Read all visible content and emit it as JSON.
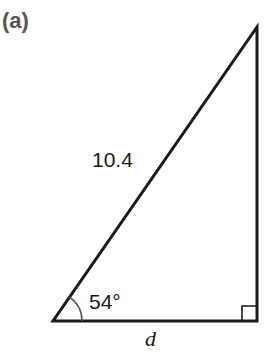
{
  "figure": {
    "part_label": "(a)",
    "hypotenuse_label": "10.4",
    "angle_label": "54°",
    "base_label": "d",
    "right_angle_marker": "right-angle-square",
    "colors": {
      "stroke": "#1a1a1a",
      "arc": "#555555",
      "part_label": "#555555"
    }
  }
}
